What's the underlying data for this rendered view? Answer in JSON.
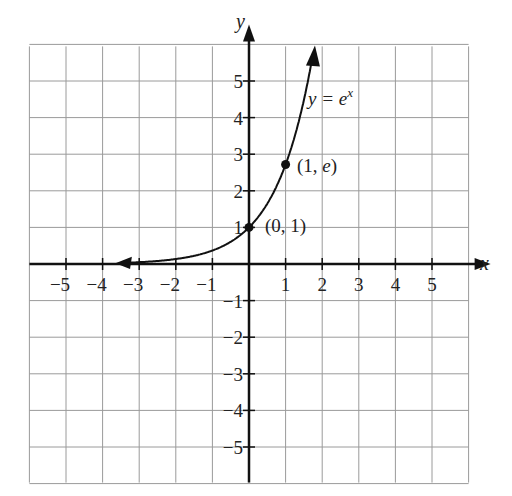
{
  "chart_data": {
    "type": "line",
    "title": "",
    "xlabel": "x",
    "ylabel": "y",
    "xlim": [
      -6,
      6
    ],
    "ylim": [
      -6,
      6
    ],
    "grid": true,
    "x_ticks": [
      "-5",
      "-4",
      "-3",
      "-2",
      "-1",
      "1",
      "2",
      "3",
      "4",
      "5"
    ],
    "y_ticks": [
      "5",
      "4",
      "3",
      "2",
      "1",
      "-1",
      "-2",
      "-3",
      "-4",
      "-5"
    ],
    "series": [
      {
        "name": "y = e^x",
        "function": "e^x",
        "x": [
          -3.5,
          -3,
          -2,
          -1,
          0,
          0.5,
          1,
          1.5,
          1.75
        ],
        "y": [
          0.03,
          0.05,
          0.14,
          0.37,
          1,
          1.65,
          2.72,
          4.48,
          5.75
        ]
      }
    ],
    "points": [
      {
        "x": 0,
        "y": 1,
        "label": "(0, 1)"
      },
      {
        "x": 1,
        "y": 2.718,
        "label": "(1, e)"
      }
    ],
    "annotations": [
      {
        "text": "y = e",
        "superscript": "x",
        "x": 1.3,
        "y": 4.6
      }
    ]
  },
  "labels": {
    "x_axis": "x",
    "y_axis": "y",
    "curve_label_base": "y = e",
    "curve_label_exp": "x",
    "point_a": "(0, 1)",
    "point_b_open": "(1, ",
    "point_b_e": "e",
    "point_b_close": ")"
  }
}
